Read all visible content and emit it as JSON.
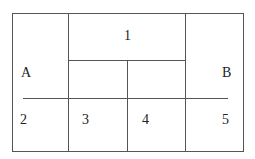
{
  "diagram": {
    "labels": {
      "one": "1",
      "a": "A",
      "b": "B",
      "two": "2",
      "three": "3",
      "four": "4",
      "five": "5"
    },
    "line_color": "#444444"
  }
}
